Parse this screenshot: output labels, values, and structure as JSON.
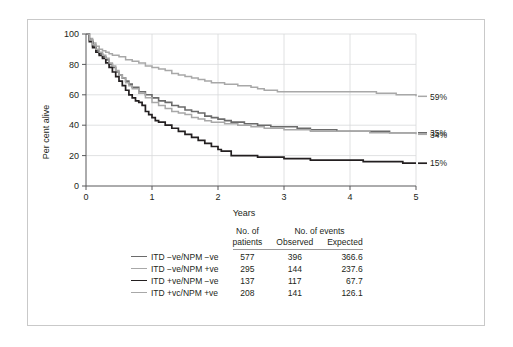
{
  "figure": {
    "title": ""
  },
  "chart_data": {
    "type": "line",
    "subtype": "kaplan-meier-survival",
    "title": "",
    "xlabel": "Years",
    "ylabel": "Per cent alive",
    "xlim": [
      0,
      5
    ],
    "ylim": [
      0,
      100
    ],
    "xticks": [
      "0",
      "1",
      "2",
      "3",
      "4",
      "5"
    ],
    "yticks": [
      "0",
      "20",
      "40",
      "60",
      "80",
      "100"
    ],
    "grid": true,
    "legend_position": "bottom-table",
    "series": [
      {
        "name": "ITD −ve/NPM −ve",
        "endpoint_label": "35%",
        "endpoint_value": 35,
        "color": "#6b6b6b",
        "width": 1.6,
        "no_of_patients": "577",
        "events_observed": "396",
        "events_expected": "366.6",
        "points": [
          [
            0.0,
            100
          ],
          [
            0.05,
            96
          ],
          [
            0.1,
            92
          ],
          [
            0.15,
            89
          ],
          [
            0.2,
            87
          ],
          [
            0.25,
            85
          ],
          [
            0.3,
            83
          ],
          [
            0.35,
            80
          ],
          [
            0.4,
            78
          ],
          [
            0.45,
            75
          ],
          [
            0.5,
            73
          ],
          [
            0.55,
            71
          ],
          [
            0.6,
            69
          ],
          [
            0.65,
            67
          ],
          [
            0.7,
            65
          ],
          [
            0.8,
            62
          ],
          [
            0.9,
            60
          ],
          [
            1.0,
            58
          ],
          [
            1.1,
            56
          ],
          [
            1.2,
            55
          ],
          [
            1.3,
            53
          ],
          [
            1.4,
            52
          ],
          [
            1.5,
            50
          ],
          [
            1.6,
            49
          ],
          [
            1.7,
            48
          ],
          [
            1.8,
            46
          ],
          [
            1.9,
            45
          ],
          [
            2.0,
            44
          ],
          [
            2.1,
            43
          ],
          [
            2.2,
            42
          ],
          [
            2.3,
            42
          ],
          [
            2.4,
            41
          ],
          [
            2.5,
            41
          ],
          [
            2.6,
            40
          ],
          [
            2.7,
            40
          ],
          [
            2.8,
            39
          ],
          [
            3.0,
            39
          ],
          [
            3.2,
            38
          ],
          [
            3.4,
            37
          ],
          [
            3.6,
            37
          ],
          [
            3.8,
            36
          ],
          [
            4.0,
            36
          ],
          [
            4.3,
            36
          ],
          [
            4.6,
            35
          ],
          [
            5.0,
            35
          ]
        ]
      },
      {
        "name": "ITD −ve/NPM +ve",
        "endpoint_label": "59%",
        "endpoint_value": 59,
        "color": "#a8a8a8",
        "width": 1.5,
        "no_of_patients": "295",
        "events_observed": "144",
        "events_expected": "237.6",
        "points": [
          [
            0.0,
            100
          ],
          [
            0.05,
            97
          ],
          [
            0.1,
            94
          ],
          [
            0.15,
            92
          ],
          [
            0.2,
            90
          ],
          [
            0.25,
            89
          ],
          [
            0.3,
            88
          ],
          [
            0.35,
            87
          ],
          [
            0.4,
            86
          ],
          [
            0.5,
            85
          ],
          [
            0.6,
            83
          ],
          [
            0.7,
            82
          ],
          [
            0.8,
            81
          ],
          [
            0.9,
            79
          ],
          [
            1.0,
            78
          ],
          [
            1.1,
            77
          ],
          [
            1.2,
            76
          ],
          [
            1.3,
            74
          ],
          [
            1.4,
            73
          ],
          [
            1.5,
            72
          ],
          [
            1.6,
            71
          ],
          [
            1.7,
            70
          ],
          [
            1.8,
            69
          ],
          [
            1.9,
            68
          ],
          [
            2.0,
            68
          ],
          [
            2.1,
            67
          ],
          [
            2.2,
            67
          ],
          [
            2.3,
            66
          ],
          [
            2.4,
            66
          ],
          [
            2.5,
            65
          ],
          [
            2.6,
            64
          ],
          [
            2.7,
            63
          ],
          [
            2.8,
            63
          ],
          [
            2.9,
            62
          ],
          [
            3.0,
            62
          ],
          [
            3.4,
            62
          ],
          [
            3.8,
            62
          ],
          [
            4.2,
            62
          ],
          [
            4.4,
            61
          ],
          [
            4.7,
            60
          ],
          [
            5.0,
            59
          ]
        ]
      },
      {
        "name": "ITD +ve/NPM −ve",
        "endpoint_label": "15%",
        "endpoint_value": 15,
        "color": "#231f20",
        "width": 1.7,
        "no_of_patients": "137",
        "events_observed": "117",
        "events_expected": "67.7",
        "points": [
          [
            0.0,
            100
          ],
          [
            0.05,
            95
          ],
          [
            0.1,
            91
          ],
          [
            0.15,
            88
          ],
          [
            0.2,
            86
          ],
          [
            0.25,
            84
          ],
          [
            0.3,
            81
          ],
          [
            0.35,
            78
          ],
          [
            0.4,
            75
          ],
          [
            0.45,
            72
          ],
          [
            0.5,
            69
          ],
          [
            0.55,
            66
          ],
          [
            0.6,
            63
          ],
          [
            0.65,
            60
          ],
          [
            0.7,
            58
          ],
          [
            0.75,
            56
          ],
          [
            0.8,
            55
          ],
          [
            0.85,
            53
          ],
          [
            0.9,
            49
          ],
          [
            0.95,
            47
          ],
          [
            1.0,
            45
          ],
          [
            1.05,
            43
          ],
          [
            1.1,
            42
          ],
          [
            1.2,
            40
          ],
          [
            1.3,
            38
          ],
          [
            1.4,
            36
          ],
          [
            1.5,
            34
          ],
          [
            1.6,
            32
          ],
          [
            1.7,
            30
          ],
          [
            1.8,
            28
          ],
          [
            1.9,
            26
          ],
          [
            2.0,
            24
          ],
          [
            2.05,
            23
          ],
          [
            2.1,
            23
          ],
          [
            2.2,
            20
          ],
          [
            2.4,
            20
          ],
          [
            2.6,
            19
          ],
          [
            2.8,
            19
          ],
          [
            3.0,
            18
          ],
          [
            3.2,
            18
          ],
          [
            3.4,
            17
          ],
          [
            3.6,
            17
          ],
          [
            3.8,
            17
          ],
          [
            4.0,
            17
          ],
          [
            4.2,
            16
          ],
          [
            4.6,
            16
          ],
          [
            4.8,
            15
          ],
          [
            5.0,
            15
          ]
        ]
      },
      {
        "name": "ITD +ve/NPM +ve",
        "endpoint_label": "34%",
        "endpoint_value": 34,
        "color": "#a8a8a8",
        "width": 1.5,
        "no_of_patients": "208",
        "events_observed": "141",
        "events_expected": "126.1",
        "points": [
          [
            0.0,
            100
          ],
          [
            0.05,
            96
          ],
          [
            0.1,
            93
          ],
          [
            0.15,
            90
          ],
          [
            0.2,
            88
          ],
          [
            0.25,
            86
          ],
          [
            0.3,
            84
          ],
          [
            0.35,
            81
          ],
          [
            0.4,
            79
          ],
          [
            0.45,
            76
          ],
          [
            0.5,
            73
          ],
          [
            0.55,
            71
          ],
          [
            0.6,
            68
          ],
          [
            0.65,
            66
          ],
          [
            0.7,
            64
          ],
          [
            0.8,
            61
          ],
          [
            0.9,
            58
          ],
          [
            1.0,
            55
          ],
          [
            1.1,
            53
          ],
          [
            1.2,
            51
          ],
          [
            1.3,
            49
          ],
          [
            1.4,
            48
          ],
          [
            1.5,
            47
          ],
          [
            1.6,
            45
          ],
          [
            1.7,
            44
          ],
          [
            1.8,
            43
          ],
          [
            1.9,
            42
          ],
          [
            2.0,
            42
          ],
          [
            2.1,
            41
          ],
          [
            2.2,
            41
          ],
          [
            2.3,
            40
          ],
          [
            2.4,
            40
          ],
          [
            2.5,
            39
          ],
          [
            2.6,
            39
          ],
          [
            2.7,
            38
          ],
          [
            2.8,
            38
          ],
          [
            3.0,
            37
          ],
          [
            3.2,
            37
          ],
          [
            3.4,
            36
          ],
          [
            3.6,
            36
          ],
          [
            3.8,
            36
          ],
          [
            4.0,
            36
          ],
          [
            4.3,
            35
          ],
          [
            4.6,
            35
          ],
          [
            5.0,
            34
          ]
        ]
      }
    ]
  },
  "table": {
    "header_patients_line1": "No. of",
    "header_patients_line2": "patients",
    "header_events": "No. of events",
    "header_observed": "Observed",
    "header_expected": "Expected",
    "rows": [
      {
        "label": "ITD −ve/NPM −ve",
        "patients": "577",
        "observed": "396",
        "expected": "366.6",
        "color": "#6b6b6b"
      },
      {
        "label": "ITD  −ve/NPM +ve",
        "patients": "295",
        "observed": "144",
        "expected": "237.6",
        "color": "#a8a8a8"
      },
      {
        "label": "ITD +ve/NPM −ve",
        "patients": "137",
        "observed": "117",
        "expected": "67.7",
        "color": "#231f20"
      },
      {
        "label": "ITD +vc/NPM +ve",
        "patients": "208",
        "observed": "141",
        "expected": "126.1",
        "color": "#a8a8a8"
      }
    ]
  },
  "colors": {
    "frame": "#c9c9c9",
    "axis": "#58595b",
    "grid": "#d8d9da",
    "text": "#231f20"
  }
}
